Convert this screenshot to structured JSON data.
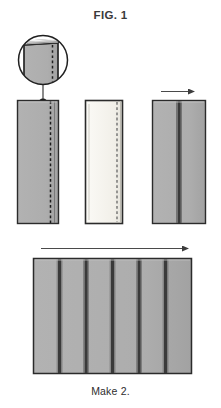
{
  "figure": {
    "title": "FIG. 1",
    "caption": "Make 2.",
    "type": "sewing-instruction-diagram"
  },
  "colors": {
    "fabric_gray": "#adadad",
    "fabric_gray_shade": "#9e9e9e",
    "fabric_light": "#f2f0ea",
    "outline_dark": "#2b2b2b",
    "seam_dark": "#3a3a3a",
    "stitch_dash": "#1f1f1f",
    "arrow": "#4a4a4a",
    "background": "#ffffff",
    "text": "#3a3a3a"
  },
  "detail_callout": {
    "name": "magnified-fold-detail",
    "shape": "circle",
    "center_x": 43,
    "center_y": 60,
    "radius": 25,
    "contents": "folded fabric edge with dashed stitch line",
    "leader_line": {
      "from_x": 43,
      "from_y": 85,
      "to_x": 43,
      "to_y": 101
    },
    "marker": {
      "x": 43,
      "y": 103,
      "radius": 4
    }
  },
  "steps": [
    {
      "id": "step-1",
      "name": "folded-strip-gray",
      "label": "gray strip with folded edge and dashed stitch line",
      "x": 17,
      "y": 100,
      "width": 42,
      "height": 124,
      "fill": "#adadad",
      "stitch_line_x": 51,
      "stitch_style": "dashed",
      "fold_line_x": 49
    },
    {
      "id": "step-2",
      "name": "folded-strip-light",
      "label": "light strip with folded edge and dashed stitch line",
      "x": 85,
      "y": 100,
      "width": 38,
      "height": 124,
      "fill": "#f2f0ea",
      "stitch_line_x": 115,
      "stitch_style": "dashed",
      "fold_line_x": 113
    },
    {
      "id": "step-3",
      "name": "joined-strip-pair",
      "label": "two strips joined with pressed seam, arrow shows press direction",
      "x": 152,
      "y": 100,
      "width": 54,
      "height": 124,
      "fill": "#adadad",
      "seam_line_x": 179,
      "arrow": {
        "name": "press-direction-arrow",
        "x1": 160,
        "x2": 197,
        "y": 92,
        "direction": "right"
      }
    }
  ],
  "panel": {
    "id": "step-4",
    "name": "assembled-strip-panel",
    "label": "assembled panel of six strips with five seams",
    "x": 33,
    "y": 258,
    "width": 159,
    "height": 116,
    "fill": "#adadad",
    "seam_count": 5,
    "column_count": 6,
    "seam_positions": [
      59,
      85,
      112,
      138,
      165
    ],
    "arrow": {
      "name": "press-direction-arrow",
      "x1": 41,
      "x2": 190,
      "y": 249,
      "direction": "right"
    }
  }
}
